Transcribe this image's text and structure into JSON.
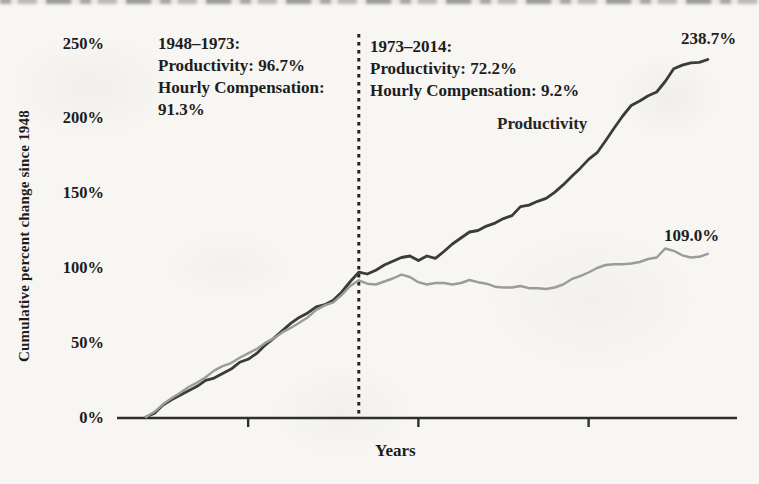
{
  "figure": {
    "y_axis_label": "Cumulative percent change since 1948",
    "x_axis_label": "Years",
    "productivity_line_label": "Productivity",
    "productivity_end_label": "238.7%",
    "compensation_end_label": "109.0%"
  },
  "annotations": {
    "period1": {
      "lines": [
        "1948–1973:",
        "Productivity: 96.7%",
        "Hourly Compensation:",
        "91.3%"
      ]
    },
    "period2": {
      "lines": [
        "1973–2014:",
        "Productivity: 72.2%",
        "Hourly Compensation: 9.2%"
      ]
    }
  },
  "colors": {
    "productivity_line": "#3b3b3b",
    "compensation_line": "#9b9b9b",
    "axis": "#2f2f2f",
    "divider": "#222222",
    "text": "#1c1c1c"
  },
  "chart_data": {
    "type": "line",
    "title": "",
    "xlabel": "Years",
    "ylabel": "Cumulative percent change since 1948",
    "x_range": [
      1948,
      2014
    ],
    "ylim": [
      0,
      250
    ],
    "grid": false,
    "legend_position": "none",
    "divider_year": 1973,
    "x_ticks_unlabeled": [
      1960,
      1980,
      2000
    ],
    "y_ticks": [
      {
        "value": 0,
        "label": "0%"
      },
      {
        "value": 50,
        "label": "50%"
      },
      {
        "value": 100,
        "label": "100%"
      },
      {
        "value": 150,
        "label": "150%"
      },
      {
        "value": 200,
        "label": "200%"
      },
      {
        "value": 250,
        "label": "250%"
      }
    ],
    "annotations": [
      "1948-1973: Productivity 96.7%, Hourly Compensation 91.3%",
      "1973-2014: Productivity 72.2%, Hourly Compensation 9.2%"
    ],
    "series": [
      {
        "name": "Productivity",
        "end_value": 238.7,
        "points": [
          [
            1948,
            0
          ],
          [
            1949,
            2.5
          ],
          [
            1950,
            8
          ],
          [
            1951,
            11.5
          ],
          [
            1952,
            14.5
          ],
          [
            1953,
            17.5
          ],
          [
            1954,
            20.5
          ],
          [
            1955,
            24.5
          ],
          [
            1956,
            26
          ],
          [
            1957,
            29
          ],
          [
            1958,
            32
          ],
          [
            1959,
            36.5
          ],
          [
            1960,
            38.5
          ],
          [
            1961,
            42.5
          ],
          [
            1962,
            48
          ],
          [
            1963,
            52.5
          ],
          [
            1964,
            57.5
          ],
          [
            1965,
            62.5
          ],
          [
            1966,
            66.5
          ],
          [
            1967,
            69.5
          ],
          [
            1968,
            73.5
          ],
          [
            1969,
            75
          ],
          [
            1970,
            78
          ],
          [
            1971,
            83.5
          ],
          [
            1972,
            90.5
          ],
          [
            1973,
            96.7
          ],
          [
            1974,
            95.5
          ],
          [
            1975,
            98
          ],
          [
            1976,
            101.5
          ],
          [
            1977,
            104
          ],
          [
            1978,
            106.5
          ],
          [
            1979,
            107.5
          ],
          [
            1980,
            104.5
          ],
          [
            1981,
            107.5
          ],
          [
            1982,
            106
          ],
          [
            1983,
            110.5
          ],
          [
            1984,
            115.5
          ],
          [
            1985,
            119.5
          ],
          [
            1986,
            123.5
          ],
          [
            1987,
            124.5
          ],
          [
            1988,
            127.5
          ],
          [
            1989,
            129.5
          ],
          [
            1990,
            132.5
          ],
          [
            1991,
            134.5
          ],
          [
            1992,
            140.5
          ],
          [
            1993,
            141.5
          ],
          [
            1994,
            144
          ],
          [
            1995,
            146
          ],
          [
            1996,
            150
          ],
          [
            1997,
            155
          ],
          [
            1998,
            160.5
          ],
          [
            1999,
            166
          ],
          [
            2000,
            172
          ],
          [
            2001,
            176.5
          ],
          [
            2002,
            184.5
          ],
          [
            2003,
            193
          ],
          [
            2004,
            201
          ],
          [
            2005,
            208
          ],
          [
            2006,
            211
          ],
          [
            2007,
            214.5
          ],
          [
            2008,
            217
          ],
          [
            2009,
            224
          ],
          [
            2010,
            232.5
          ],
          [
            2011,
            235
          ],
          [
            2012,
            236.5
          ],
          [
            2013,
            236.8
          ],
          [
            2014,
            238.7
          ]
        ]
      },
      {
        "name": "Hourly Compensation",
        "end_value": 109.0,
        "points": [
          [
            1948,
            0
          ],
          [
            1949,
            3.5
          ],
          [
            1950,
            8.5
          ],
          [
            1951,
            12.5
          ],
          [
            1952,
            16
          ],
          [
            1953,
            20
          ],
          [
            1954,
            23
          ],
          [
            1955,
            26.5
          ],
          [
            1956,
            31
          ],
          [
            1957,
            34
          ],
          [
            1958,
            36
          ],
          [
            1959,
            39.5
          ],
          [
            1960,
            42.5
          ],
          [
            1961,
            45.5
          ],
          [
            1962,
            49.5
          ],
          [
            1963,
            52.5
          ],
          [
            1964,
            56.5
          ],
          [
            1965,
            59.5
          ],
          [
            1966,
            63
          ],
          [
            1967,
            66.5
          ],
          [
            1968,
            71.5
          ],
          [
            1969,
            74.5
          ],
          [
            1970,
            76.5
          ],
          [
            1971,
            81.5
          ],
          [
            1972,
            87.5
          ],
          [
            1973,
            91.3
          ],
          [
            1974,
            89
          ],
          [
            1975,
            88.5
          ],
          [
            1976,
            90.5
          ],
          [
            1977,
            92.5
          ],
          [
            1978,
            95
          ],
          [
            1979,
            93.5
          ],
          [
            1980,
            90
          ],
          [
            1981,
            88.5
          ],
          [
            1982,
            89.5
          ],
          [
            1983,
            89.5
          ],
          [
            1984,
            88.5
          ],
          [
            1985,
            89.5
          ],
          [
            1986,
            91.5
          ],
          [
            1987,
            90
          ],
          [
            1988,
            89
          ],
          [
            1989,
            87
          ],
          [
            1990,
            86.5
          ],
          [
            1991,
            86.5
          ],
          [
            1992,
            87.5
          ],
          [
            1993,
            86
          ],
          [
            1994,
            86
          ],
          [
            1995,
            85.5
          ],
          [
            1996,
            86.5
          ],
          [
            1997,
            88.5
          ],
          [
            1998,
            92
          ],
          [
            1999,
            94
          ],
          [
            2000,
            96.5
          ],
          [
            2001,
            99.5
          ],
          [
            2002,
            101.5
          ],
          [
            2003,
            102
          ],
          [
            2004,
            102
          ],
          [
            2005,
            102.5
          ],
          [
            2006,
            103.5
          ],
          [
            2007,
            105.5
          ],
          [
            2008,
            106.5
          ],
          [
            2009,
            112.5
          ],
          [
            2010,
            111
          ],
          [
            2011,
            108
          ],
          [
            2012,
            106.5
          ],
          [
            2013,
            107
          ],
          [
            2014,
            109
          ]
        ]
      }
    ]
  }
}
